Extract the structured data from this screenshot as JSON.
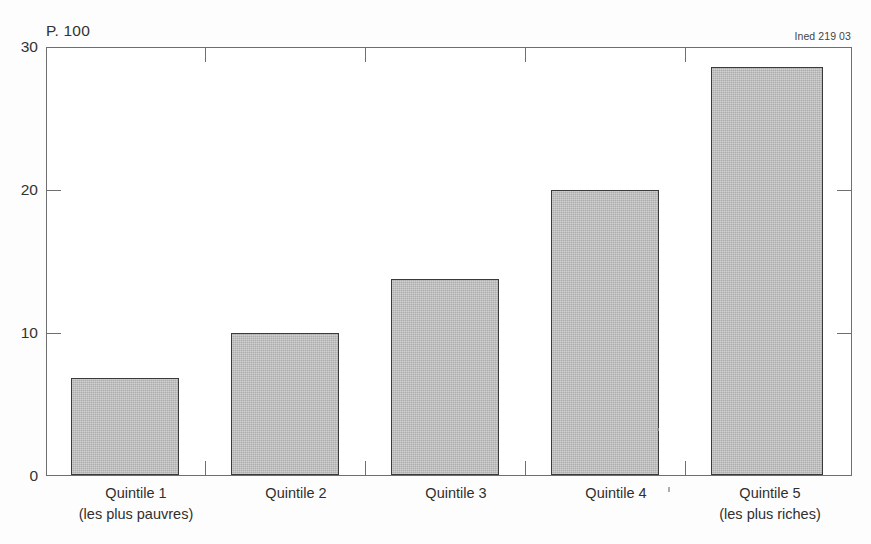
{
  "figure": {
    "unit_label": "P. 100",
    "source_credit": "Ined 219 03"
  },
  "chart_data": {
    "type": "bar",
    "title": "",
    "subtitle": "",
    "xlabel": "",
    "ylabel": "P. 100",
    "categories": [
      "Quintile 1",
      "Quintile 2",
      "Quintile 3",
      "Quintile 4",
      "Quintile 5"
    ],
    "category_sublabels": [
      "(les plus pauvres)",
      "",
      "",
      "",
      "(les plus riches)"
    ],
    "values": [
      6.8,
      10.0,
      13.8,
      20.0,
      28.7
    ],
    "ylim": [
      0,
      30
    ],
    "yticks": [
      0,
      10,
      20,
      30
    ],
    "ytick_labels": [
      "0",
      "10",
      "20",
      "30"
    ],
    "grid": false,
    "legend": "none",
    "bar_fill": "#b9b9b9",
    "bar_edge": "#3a3a3a",
    "axis_color": "#6f6f6f"
  },
  "axis": {
    "y_labels": [
      "30",
      "20",
      "10",
      "0"
    ]
  }
}
